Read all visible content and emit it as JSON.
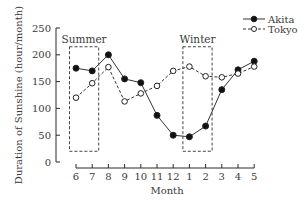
{
  "chart_data": {
    "type": "line",
    "title": "",
    "xlabel": "Month",
    "ylabel": "Duration of Sunshine (hour/month)",
    "categories": [
      "6",
      "7",
      "8",
      "9",
      "10",
      "11",
      "12",
      "1",
      "2",
      "3",
      "4",
      "5"
    ],
    "ylim": [
      0,
      250
    ],
    "yticks": [
      0,
      50,
      100,
      150,
      200,
      250
    ],
    "grid": false,
    "legend_position": "top-right",
    "series": [
      {
        "name": "Akita",
        "marker": "filled-circle",
        "line": "solid",
        "values": [
          175,
          170,
          200,
          155,
          148,
          87,
          50,
          47,
          67,
          135,
          172,
          188
        ]
      },
      {
        "name": "Tokyo",
        "marker": "open-circle",
        "line": "dashed",
        "values": [
          120,
          147,
          177,
          113,
          128,
          142,
          170,
          178,
          160,
          158,
          165,
          178
        ]
      }
    ],
    "annotations": [
      {
        "label": "Summer",
        "type": "dashed-box",
        "x_range": [
          "6",
          "7"
        ],
        "y_range": [
          20,
          215
        ]
      },
      {
        "label": "Winter",
        "type": "dashed-box",
        "x_range": [
          "1",
          "2"
        ],
        "y_range": [
          20,
          215
        ]
      }
    ]
  }
}
